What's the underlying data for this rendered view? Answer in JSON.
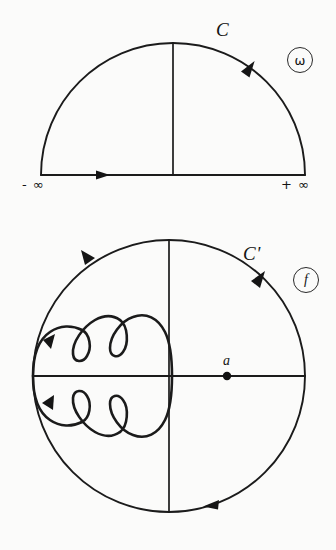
{
  "figure": {
    "title_visible": false,
    "background_color": "#fbfbfa",
    "ink_color": "#1b1b1b"
  },
  "upper_panel": {
    "name": "omega-plane-semicircular-contour",
    "contour_label": "C",
    "plane_badge": "ω",
    "plane_badge_icon": "circled-omega-icon",
    "left_endpoint_label": "- ∞",
    "right_endpoint_label": "+ ∞",
    "geometry": {
      "center_x": 173,
      "baseline_y": 175,
      "radius": 132,
      "apex_y": 43,
      "vertical_radius_line": true
    },
    "direction": "counterclockwise",
    "arrows": [
      {
        "name": "baseline-arrow",
        "x": 103,
        "y": 175,
        "angle_deg": 0
      },
      {
        "name": "arc-arrow-upper-right",
        "x": 247,
        "y": 68,
        "angle_deg": 133
      }
    ]
  },
  "lower_panel": {
    "name": "f-plane-image-contour",
    "contour_label": "C'",
    "plane_badge": "f",
    "plane_badge_icon": "circled-f-icon",
    "point_label": "a",
    "point_marker_icon": "filled-dot-icon",
    "point_position": {
      "x": 227,
      "y": 376
    },
    "geometry": {
      "center_x": 169,
      "center_y": 376,
      "radius": 136,
      "horizontal_diameter": true,
      "vertical_diameter": true
    },
    "direction": "counterclockwise",
    "arrows": [
      {
        "name": "circle-arrow-upper-left",
        "x": 88,
        "y": 256,
        "angle_deg": 235
      },
      {
        "name": "circle-arrow-upper-right",
        "x": 258,
        "y": 278,
        "angle_deg": 124
      },
      {
        "name": "circle-arrow-bottom",
        "x": 210,
        "y": 505,
        "angle_deg": 196
      },
      {
        "name": "inner-loop-arrow-upper",
        "x": 49,
        "y": 344,
        "angle_deg": 225
      },
      {
        "name": "inner-loop-arrow-lower",
        "x": 48,
        "y": 400,
        "angle_deg": 130
      }
    ],
    "inner_curve": {
      "name": "looped-image-curve",
      "description": "closed looped curve in left half, two cusp loops above axis and two mirrored below",
      "loops_above_axis": 2,
      "loops_below_axis": 2,
      "left_extent_x": 33,
      "right_extent_x": 172
    }
  }
}
